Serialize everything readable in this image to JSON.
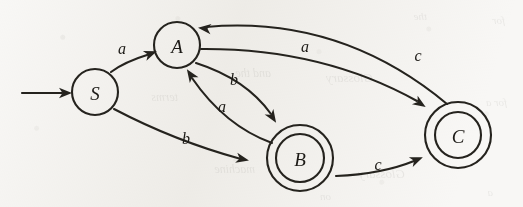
{
  "figure": {
    "kind": "finite-state-automaton-diagram",
    "background_color": "#f8f7f5",
    "ink_color": "#25231e",
    "width": 523,
    "height": 207
  },
  "bleed_through_text": {
    "note": "faint illegible show-through text from the reverse side of the scanned page",
    "fragments": [
      {
        "text": "for",
        "x": 18,
        "y": 14,
        "size": 11
      },
      {
        "text": "the",
        "x": 96,
        "y": 10,
        "size": 11
      },
      {
        "text": "Glossary",
        "x": 150,
        "y": 70,
        "size": 13
      },
      {
        "text": "and the",
        "x": 252,
        "y": 66,
        "size": 12
      },
      {
        "text": "terms",
        "x": 345,
        "y": 90,
        "size": 12
      },
      {
        "text": "for a",
        "x": 16,
        "y": 96,
        "size": 11
      },
      {
        "text": "Glossary",
        "x": 118,
        "y": 166,
        "size": 13
      },
      {
        "text": "machine",
        "x": 268,
        "y": 162,
        "size": 12
      },
      {
        "text": "a",
        "x": 30,
        "y": 186,
        "size": 11
      },
      {
        "text": "on",
        "x": 192,
        "y": 190,
        "size": 11
      }
    ]
  },
  "start_marker": {
    "name": "start-arrow",
    "from_x": 22,
    "to_x": 70,
    "y": 93,
    "target_state": "S"
  },
  "states": [
    {
      "id": "S",
      "label": "S",
      "cx": 95,
      "cy": 92,
      "radius": 23,
      "accepting": false,
      "start": true
    },
    {
      "id": "A",
      "label": "A",
      "cx": 177,
      "cy": 45,
      "radius": 23,
      "accepting": false,
      "start": false
    },
    {
      "id": "B",
      "label": "B",
      "cx": 300,
      "cy": 158,
      "radius": 24,
      "outer_radius": 33,
      "accepting": true,
      "start": false
    },
    {
      "id": "C",
      "label": "C",
      "cx": 458,
      "cy": 135,
      "radius": 23,
      "outer_radius": 33,
      "accepting": true,
      "start": false
    }
  ],
  "transitions": [
    {
      "id": "S-a-A",
      "from": "S",
      "to": "A",
      "label": "a",
      "label_x": 122,
      "label_y": 48,
      "path": "M 111 72 Q 124 62 150 54",
      "arrow_x": 155,
      "arrow_y": 52,
      "arrow_angle": -20
    },
    {
      "id": "S-b-B",
      "from": "S",
      "to": "B",
      "label": "b",
      "label_x": 186,
      "label_y": 138,
      "path": "M 114 109 Q 175 141 241 159",
      "arrow_x": 247,
      "arrow_y": 160,
      "arrow_angle": 12
    },
    {
      "id": "A-b-B",
      "from": "A",
      "to": "B",
      "label": "b",
      "label_x": 234,
      "label_y": 79,
      "path": "M 196 63 Q 246 79 271 114",
      "arrow_x": 275,
      "arrow_y": 121,
      "arrow_angle": 57
    },
    {
      "id": "B-a-A",
      "from": "B",
      "to": "A",
      "label": "a",
      "label_x": 222,
      "label_y": 106,
      "path": "M 272 143 Q 225 126 192 78",
      "arrow_x": 188,
      "arrow_y": 71,
      "arrow_angle": -124
    },
    {
      "id": "A-a-C",
      "from": "A",
      "to": "C",
      "label": "a",
      "label_x": 305,
      "label_y": 46,
      "path": "M 201 49 Q 322 48 417 101",
      "arrow_x": 424,
      "arrow_y": 106,
      "arrow_angle": 33
    },
    {
      "id": "C-c-A",
      "from": "C",
      "to": "A",
      "label": "c",
      "label_x": 418,
      "label_y": 55,
      "path": "M 206 27 Q 340 15 447 104",
      "arrow_x": 200,
      "arrow_y": 28,
      "arrow_angle": 186
    },
    {
      "id": "B-c-C",
      "from": "B",
      "to": "C",
      "label": "c",
      "label_x": 378,
      "label_y": 164,
      "path": "M 336 176 Q 382 174 414 161",
      "arrow_x": 421,
      "arrow_y": 158,
      "arrow_angle": -22
    }
  ]
}
